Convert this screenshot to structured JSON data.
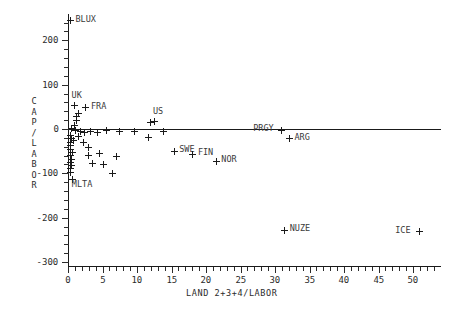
{
  "chart_data": {
    "type": "scatter",
    "title": "",
    "xlabel": "LAND 2+3+4/LABOR",
    "ylabel": "CAP/LABOR",
    "xlim": [
      -1,
      53.5
    ],
    "ylim": [
      -300,
      260
    ],
    "xticks": [
      0,
      5,
      10,
      15,
      20,
      25,
      30,
      35,
      40,
      45,
      50
    ],
    "yticks": [
      200,
      100,
      0,
      -100,
      -200,
      -300
    ],
    "xtick_labels": [
      "0",
      "5",
      "10",
      "15",
      "20",
      "25",
      "30",
      "35",
      "40",
      "45",
      "50"
    ],
    "ytick_labels": [
      "200",
      "100",
      "0",
      "-100",
      "-200",
      "-300"
    ],
    "grid": false,
    "legend": "none",
    "y_zero_line": true,
    "marker_symbol": "+",
    "marker_color": "#1a1a1a",
    "points": [
      {
        "label": "BLUX",
        "x": 0.35,
        "y": 244,
        "lx": 5,
        "ly": -4
      },
      {
        "label": "UK",
        "x": 0.95,
        "y": 52,
        "lx": -3,
        "ly": -13
      },
      {
        "label": "FRA",
        "x": 2.6,
        "y": 48,
        "lx": 5,
        "ly": -4
      },
      {
        "label": "US",
        "x": 12.6,
        "y": 16,
        "lx": -2,
        "ly": -13
      },
      {
        "label": "SWE",
        "x": 15.4,
        "y": -50,
        "lx": 5,
        "ly": -4
      },
      {
        "label": "FIN",
        "x": 18.1,
        "y": -57,
        "lx": 5,
        "ly": -4
      },
      {
        "label": "NOR",
        "x": 21.5,
        "y": -73,
        "lx": 5,
        "ly": -4
      },
      {
        "label": "PRGY",
        "x": 30.9,
        "y": -3,
        "lx": -28,
        "ly": -4
      },
      {
        "label": "ARG",
        "x": 32.1,
        "y": -22,
        "lx": 5,
        "ly": -4
      },
      {
        "label": "MLTA",
        "x": 0.7,
        "y": -113,
        "lx": -1,
        "ly": 3
      },
      {
        "label": "NUZE",
        "x": 31.4,
        "y": -228,
        "lx": 5,
        "ly": -4
      },
      {
        "label": "ICE",
        "x": 50.9,
        "y": -232,
        "lx": -24,
        "ly": -4
      },
      {
        "label": "",
        "x": 1.5,
        "y": 36,
        "lx": 0,
        "ly": 0
      },
      {
        "label": "",
        "x": 1.2,
        "y": 28,
        "lx": 0,
        "ly": 0
      },
      {
        "label": "",
        "x": 1.3,
        "y": 20,
        "lx": 0,
        "ly": 0
      },
      {
        "label": "",
        "x": 0.9,
        "y": 8,
        "lx": 0,
        "ly": 0
      },
      {
        "label": "",
        "x": 0.5,
        "y": 2,
        "lx": 0,
        "ly": 0
      },
      {
        "label": "",
        "x": 1.1,
        "y": -4,
        "lx": 0,
        "ly": 0
      },
      {
        "label": "",
        "x": 1.8,
        "y": -6,
        "lx": 0,
        "ly": 0
      },
      {
        "label": "",
        "x": 2.4,
        "y": -9,
        "lx": 0,
        "ly": 0
      },
      {
        "label": "",
        "x": 3.2,
        "y": -5,
        "lx": 0,
        "ly": 0
      },
      {
        "label": "",
        "x": 4.3,
        "y": -8,
        "lx": 0,
        "ly": 0
      },
      {
        "label": "",
        "x": 5.6,
        "y": -4,
        "lx": 0,
        "ly": 0
      },
      {
        "label": "",
        "x": 7.5,
        "y": -6,
        "lx": 0,
        "ly": 0
      },
      {
        "label": "",
        "x": 9.6,
        "y": -6,
        "lx": 0,
        "ly": 0
      },
      {
        "label": "",
        "x": 11.6,
        "y": -20,
        "lx": 0,
        "ly": 0
      },
      {
        "label": "",
        "x": 12.0,
        "y": 14,
        "lx": 0,
        "ly": 0
      },
      {
        "label": "",
        "x": 13.9,
        "y": -6,
        "lx": 0,
        "ly": 0
      },
      {
        "label": "",
        "x": 0.35,
        "y": -14,
        "lx": 0,
        "ly": 0
      },
      {
        "label": "",
        "x": 0.5,
        "y": -22,
        "lx": 0,
        "ly": 0
      },
      {
        "label": "",
        "x": 0.3,
        "y": -30,
        "lx": 0,
        "ly": 0
      },
      {
        "label": "",
        "x": 0.8,
        "y": -26,
        "lx": 0,
        "ly": 0
      },
      {
        "label": "",
        "x": 0.4,
        "y": -38,
        "lx": 0,
        "ly": 0
      },
      {
        "label": "",
        "x": 0.35,
        "y": -46,
        "lx": 0,
        "ly": 0
      },
      {
        "label": "",
        "x": 0.6,
        "y": -52,
        "lx": 0,
        "ly": 0
      },
      {
        "label": "",
        "x": 0.3,
        "y": -60,
        "lx": 0,
        "ly": 0
      },
      {
        "label": "",
        "x": 0.45,
        "y": -68,
        "lx": 0,
        "ly": 0
      },
      {
        "label": "",
        "x": 0.3,
        "y": -76,
        "lx": 0,
        "ly": 0
      },
      {
        "label": "",
        "x": 0.55,
        "y": -82,
        "lx": 0,
        "ly": 0
      },
      {
        "label": "",
        "x": 0.35,
        "y": -90,
        "lx": 0,
        "ly": 0
      },
      {
        "label": "",
        "x": 0.3,
        "y": -98,
        "lx": 0,
        "ly": 0
      },
      {
        "label": "",
        "x": 1.5,
        "y": -18,
        "lx": 0,
        "ly": 0
      },
      {
        "label": "",
        "x": 2.2,
        "y": -30,
        "lx": 0,
        "ly": 0
      },
      {
        "label": "",
        "x": 3.0,
        "y": -42,
        "lx": 0,
        "ly": 0
      },
      {
        "label": "",
        "x": 2.9,
        "y": -60,
        "lx": 0,
        "ly": 0
      },
      {
        "label": "",
        "x": 4.6,
        "y": -56,
        "lx": 0,
        "ly": 0
      },
      {
        "label": "",
        "x": 3.5,
        "y": -78,
        "lx": 0,
        "ly": 0
      },
      {
        "label": "",
        "x": 5.2,
        "y": -80,
        "lx": 0,
        "ly": 0
      },
      {
        "label": "",
        "x": 7.1,
        "y": -62,
        "lx": 0,
        "ly": 0
      },
      {
        "label": "",
        "x": 6.5,
        "y": -100,
        "lx": 0,
        "ly": 0
      }
    ]
  }
}
